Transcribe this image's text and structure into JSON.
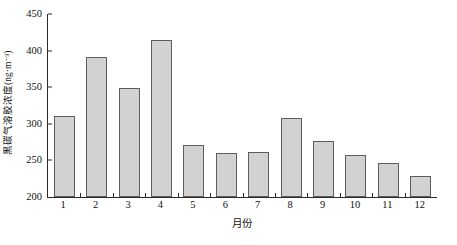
{
  "chart_data": {
    "type": "bar",
    "title": "",
    "xlabel": "月份",
    "ylabel": "黑碳气溶胶浓度(ng·m⁻³)",
    "categories": [
      "1",
      "2",
      "3",
      "4",
      "5",
      "6",
      "7",
      "8",
      "9",
      "10",
      "11",
      "12"
    ],
    "values": [
      310,
      391,
      349,
      415,
      271,
      260,
      262,
      308,
      277,
      258,
      246,
      229
    ],
    "ylim": [
      200,
      450
    ],
    "ytick_labels": [
      "200",
      "250",
      "300",
      "350",
      "400",
      "450"
    ],
    "ytick_values": [
      200,
      250,
      300,
      350,
      400,
      450
    ],
    "grid": false,
    "legend": "none",
    "series_name": "黑碳气溶胶浓度",
    "bar_fill_color": "#d2d2d2",
    "bar_border_color": "#5d5d5d",
    "axis_color": "#2b2b2b"
  }
}
